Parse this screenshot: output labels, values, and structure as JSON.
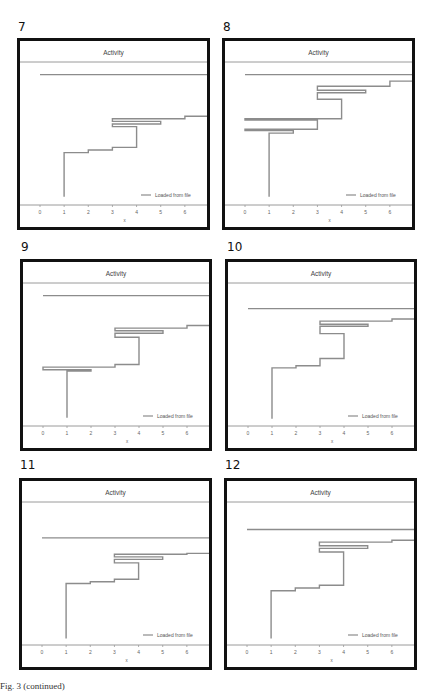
{
  "caption": "Fig. 3 (continued)",
  "chart_data": [
    {
      "panel_label": "7",
      "type": "line",
      "title": "Activity",
      "xlabel": "x",
      "ylabel": "",
      "xlim": [
        0,
        7
      ],
      "ylim": [
        0,
        100
      ],
      "xticks": [
        "0",
        "1",
        "2",
        "3",
        "4",
        "5",
        "6",
        "7"
      ],
      "legend": {
        "entries": [
          "Loaded from file"
        ],
        "placement": "bottom-right"
      },
      "series": [
        {
          "name": "Loaded from file",
          "points": [
            [
              1,
              4
            ],
            [
              1,
              38
            ],
            [
              2,
              38
            ],
            [
              2,
              40
            ],
            [
              3,
              40
            ],
            [
              3,
              42
            ],
            [
              4,
              42
            ],
            [
              4,
              58
            ],
            [
              3,
              58
            ],
            [
              3,
              60
            ],
            [
              5,
              60
            ],
            [
              5,
              62
            ],
            [
              3,
              62
            ],
            [
              3,
              64
            ],
            [
              6,
              64
            ],
            [
              6,
              66
            ],
            [
              7,
              66
            ],
            [
              7,
              98
            ],
            [
              0,
              98
            ]
          ]
        }
      ]
    },
    {
      "panel_label": "8",
      "type": "line",
      "title": "Activity",
      "xlabel": "x",
      "ylabel": "",
      "xlim": [
        0,
        7
      ],
      "ylim": [
        0,
        100
      ],
      "xticks": [
        "0",
        "1",
        "2",
        "3",
        "4",
        "5",
        "6",
        "7"
      ],
      "legend": {
        "entries": [
          "Loaded from file"
        ],
        "placement": "bottom-right"
      },
      "series": [
        {
          "name": "Loaded from file",
          "points": [
            [
              1,
              4
            ],
            [
              1,
              53
            ],
            [
              2,
              53
            ],
            [
              2,
              55
            ],
            [
              0,
              55
            ],
            [
              0,
              56
            ],
            [
              3,
              56
            ],
            [
              3,
              63
            ],
            [
              0,
              63
            ],
            [
              0,
              64
            ],
            [
              4,
              64
            ],
            [
              4,
              79
            ],
            [
              3,
              79
            ],
            [
              3,
              84
            ],
            [
              5,
              84
            ],
            [
              5,
              86
            ],
            [
              3,
              86
            ],
            [
              3,
              89
            ],
            [
              6,
              89
            ],
            [
              6,
              93
            ],
            [
              7,
              93
            ],
            [
              7,
              98
            ],
            [
              0,
              98
            ]
          ]
        }
      ]
    },
    {
      "panel_label": "9",
      "type": "line",
      "title": "Activity",
      "xlabel": "x",
      "ylabel": "",
      "xlim": [
        0,
        7
      ],
      "ylim": [
        0,
        100
      ],
      "xticks": [
        "0",
        "1",
        "2",
        "3",
        "4",
        "5",
        "6",
        "7"
      ],
      "legend": {
        "entries": [
          "Loaded from file"
        ],
        "placement": "bottom-right"
      },
      "series": [
        {
          "name": "Loaded from file",
          "points": [
            [
              1,
              4
            ],
            [
              1,
              40
            ],
            [
              2,
              40
            ],
            [
              2,
              41
            ],
            [
              0,
              41
            ],
            [
              0,
              43
            ],
            [
              3,
              43
            ],
            [
              3,
              45
            ],
            [
              4,
              45
            ],
            [
              4,
              66
            ],
            [
              3,
              66
            ],
            [
              3,
              69
            ],
            [
              5,
              69
            ],
            [
              5,
              71
            ],
            [
              3,
              71
            ],
            [
              3,
              73
            ],
            [
              6,
              73
            ],
            [
              6,
              75
            ],
            [
              7,
              75
            ]
          ]
        },
        {
          "name": "top-line",
          "points": [
            [
              0,
              98
            ],
            [
              7,
              98
            ]
          ]
        }
      ]
    },
    {
      "panel_label": "10",
      "type": "line",
      "title": "Activity",
      "xlabel": "x",
      "ylabel": "",
      "xlim": [
        0,
        7
      ],
      "ylim": [
        0,
        100
      ],
      "xticks": [
        "0",
        "1",
        "2",
        "3",
        "4",
        "5",
        "6",
        "7"
      ],
      "legend": {
        "entries": [
          "Loaded from file"
        ],
        "placement": "bottom-right"
      },
      "series": [
        {
          "name": "Loaded from file",
          "points": [
            [
              1,
              4
            ],
            [
              1,
              53
            ],
            [
              2,
              53
            ],
            [
              2,
              55
            ],
            [
              3,
              55
            ],
            [
              3,
              62
            ],
            [
              4,
              62
            ],
            [
              4,
              86
            ],
            [
              3,
              86
            ],
            [
              3,
              93
            ],
            [
              5,
              93
            ],
            [
              5,
              95
            ],
            [
              3,
              95
            ],
            [
              3,
              98
            ],
            [
              6,
              98
            ],
            [
              6,
              100
            ],
            [
              7,
              100
            ],
            [
              7,
              110
            ],
            [
              0,
              110
            ]
          ]
        }
      ]
    },
    {
      "panel_label": "11",
      "type": "line",
      "title": "Activity",
      "xlabel": "x",
      "ylabel": "",
      "xlim": [
        0,
        7
      ],
      "ylim": [
        0,
        100
      ],
      "xticks": [
        "0",
        "1",
        "2",
        "3",
        "4",
        "5",
        "6",
        "7"
      ],
      "legend": {
        "entries": [
          "Loaded from file"
        ],
        "placement": "bottom-right"
      },
      "series": [
        {
          "name": "Loaded from file",
          "points": [
            [
              1,
              4
            ],
            [
              1,
              68
            ],
            [
              2,
              68
            ],
            [
              2,
              70
            ],
            [
              3,
              70
            ],
            [
              3,
              73
            ],
            [
              4,
              73
            ],
            [
              4,
              92
            ],
            [
              3,
              92
            ],
            [
              3,
              96
            ],
            [
              5,
              96
            ],
            [
              5,
              99
            ],
            [
              3,
              99
            ],
            [
              3,
              102
            ],
            [
              6,
              102
            ],
            [
              6,
              103
            ],
            [
              7,
              103
            ]
          ]
        },
        {
          "name": "top-line",
          "points": [
            [
              0,
              121
            ],
            [
              7,
              121
            ]
          ]
        }
      ]
    },
    {
      "panel_label": "12",
      "type": "line",
      "title": "Activity",
      "xlabel": "x",
      "ylabel": "",
      "xlim": [
        0,
        7
      ],
      "ylim": [
        0,
        100
      ],
      "xticks": [
        "0",
        "1",
        "2",
        "3",
        "4",
        "5",
        "6",
        "7"
      ],
      "legend": {
        "entries": [
          "Loaded from file"
        ],
        "placement": "bottom-right"
      },
      "series": [
        {
          "name": "Loaded from file",
          "points": [
            [
              1,
              4
            ],
            [
              1,
              57
            ],
            [
              2,
              57
            ],
            [
              2,
              60
            ],
            [
              3,
              60
            ],
            [
              3,
              63
            ],
            [
              4,
              63
            ],
            [
              4,
              100
            ],
            [
              3,
              100
            ],
            [
              3,
              104
            ],
            [
              5,
              104
            ],
            [
              5,
              107
            ],
            [
              3,
              107
            ],
            [
              3,
              111
            ],
            [
              6,
              111
            ],
            [
              6,
              113
            ],
            [
              7,
              113
            ],
            [
              7,
              125
            ],
            [
              0,
              125
            ]
          ]
        }
      ]
    }
  ]
}
